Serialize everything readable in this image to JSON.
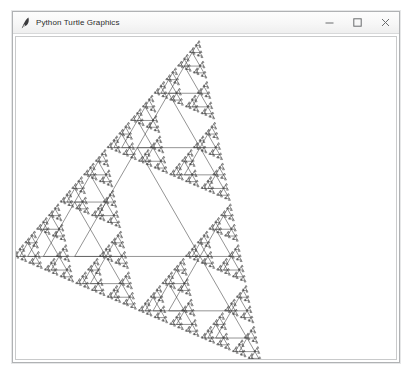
{
  "window": {
    "title": "Python Turtle Graphics",
    "icon": "python-feather-icon",
    "controls": [
      {
        "name": "minimize-button",
        "icon": "minimize-icon"
      },
      {
        "name": "maximize-button",
        "icon": "maximize-icon"
      },
      {
        "name": "close-button",
        "icon": "close-icon"
      }
    ]
  },
  "canvas": {
    "background": "#ffffff",
    "pen_color": "#3a3a3a",
    "pen_width": 0.55
  },
  "drawing": {
    "name": "recursive-triangle-fractal",
    "type": "turtle-fractal",
    "description": "Recursive equilateral triangle fractal: each triangle spawns three half-scale copies at its vertices, chained along a diagonal from upper-left to lower-right.",
    "root": {
      "apex_x": 122,
      "apex_y": 111,
      "size": 126,
      "angle": 0
    },
    "depth": 7,
    "scale_factor": 0.5,
    "branch_offsets": [
      {
        "dx": -0.5,
        "dy": -0.5
      },
      {
        "dx": 0.5,
        "dy": -0.5
      },
      {
        "dx": 0.0,
        "dy": 0.5
      }
    ],
    "min_size": 1.1
  }
}
